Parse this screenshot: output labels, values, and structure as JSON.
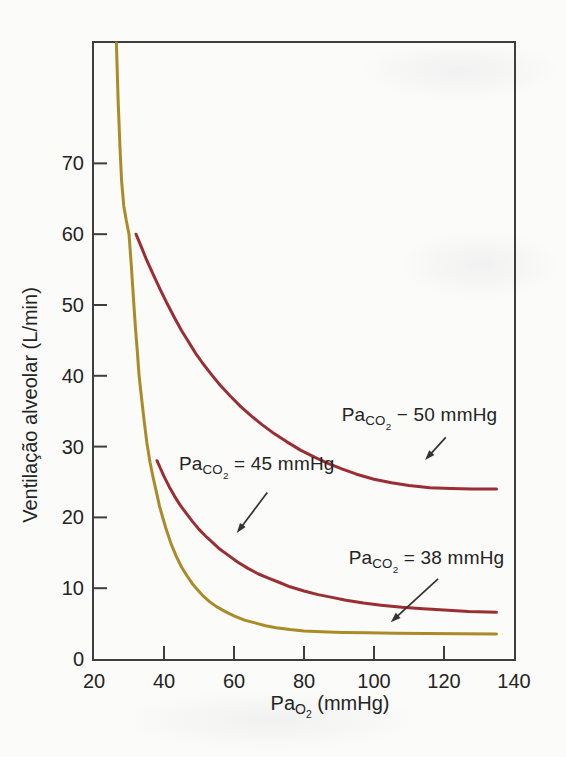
{
  "figure": {
    "background": "#fbfbf9",
    "axis_color": "#3e3e3e",
    "text_color": "#242424",
    "arrow_color": "#333333"
  },
  "chart_data": {
    "type": "line",
    "title": "",
    "ylabel": "Ventilação alveolar (L/min)",
    "xlabel": "PaO2 (mmHg)",
    "xlabel_parts": {
      "base": "Pa",
      "sub": "O",
      "subsub": "2",
      "rest": " (mmHg)"
    },
    "xlim": [
      20,
      140
    ],
    "ylim": [
      0,
      87
    ],
    "x_ticks": [
      20,
      40,
      60,
      80,
      100,
      120,
      140
    ],
    "y_ticks": [
      0,
      10,
      20,
      30,
      40,
      50,
      60,
      70
    ],
    "grid": false,
    "legend_position": "none",
    "series": [
      {
        "id": "paco2-50",
        "name": "PaCO2 − 50 mmHg",
        "color": "#9a2e33",
        "points": [
          [
            32,
            60
          ],
          [
            33.5,
            58.2
          ],
          [
            35,
            56.4
          ],
          [
            37,
            54.2
          ],
          [
            39,
            52.1
          ],
          [
            41,
            50.1
          ],
          [
            43,
            48.2
          ],
          [
            45,
            46.4
          ],
          [
            47,
            44.8
          ],
          [
            49,
            43.2
          ],
          [
            51,
            41.8
          ],
          [
            53.5,
            40.2
          ],
          [
            56,
            38.7
          ],
          [
            59,
            37.1
          ],
          [
            62,
            35.6
          ],
          [
            65,
            34.3
          ],
          [
            68,
            33.1
          ],
          [
            71,
            32
          ],
          [
            75,
            30.7
          ],
          [
            79,
            29.5
          ],
          [
            83,
            28.5
          ],
          [
            87,
            27.6
          ],
          [
            91,
            26.8
          ],
          [
            95,
            26.1
          ],
          [
            100,
            25.4
          ],
          [
            105,
            24.9
          ],
          [
            110,
            24.5
          ],
          [
            116,
            24.2
          ],
          [
            122,
            24.1
          ],
          [
            128,
            24
          ],
          [
            135,
            24
          ]
        ]
      },
      {
        "id": "paco2-45",
        "name": "PaCO2 = 45 mmHg",
        "color": "#9a2e33",
        "points": [
          [
            38,
            28
          ],
          [
            39,
            26.9
          ],
          [
            40,
            25.8
          ],
          [
            41.5,
            24.3
          ],
          [
            43,
            23
          ],
          [
            44.5,
            21.8
          ],
          [
            46,
            20.8
          ],
          [
            48,
            19.5
          ],
          [
            50,
            18.3
          ],
          [
            52,
            17.3
          ],
          [
            54,
            16.4
          ],
          [
            56,
            15.5
          ],
          [
            58.5,
            14.6
          ],
          [
            61,
            13.7
          ],
          [
            64,
            12.8
          ],
          [
            67,
            12
          ],
          [
            70,
            11.4
          ],
          [
            73,
            10.8
          ],
          [
            76,
            10.2
          ],
          [
            80,
            9.6
          ],
          [
            84,
            9.1
          ],
          [
            88,
            8.7
          ],
          [
            92,
            8.3
          ],
          [
            97,
            7.9
          ],
          [
            102,
            7.6
          ],
          [
            108,
            7.3
          ],
          [
            114,
            7.1
          ],
          [
            120,
            6.9
          ],
          [
            127,
            6.7
          ],
          [
            135,
            6.6
          ]
        ]
      },
      {
        "id": "paco2-38",
        "name": "PaCO2 = 38 mmHg",
        "color": "#ab8a28",
        "points": [
          [
            26.4,
            87
          ],
          [
            26.9,
            79
          ],
          [
            27.4,
            72.5
          ],
          [
            27.9,
            67.5
          ],
          [
            28.5,
            64
          ],
          [
            29.2,
            62
          ],
          [
            30,
            60
          ],
          [
            30.6,
            56
          ],
          [
            31,
            53
          ],
          [
            31.4,
            50
          ],
          [
            31.9,
            46.5
          ],
          [
            32.4,
            43.3
          ],
          [
            32.9,
            40
          ],
          [
            33.6,
            36.8
          ],
          [
            34.3,
            33.8
          ],
          [
            35.1,
            30.5
          ],
          [
            36,
            27.8
          ],
          [
            37,
            25.4
          ],
          [
            38,
            23.2
          ],
          [
            38.7,
            21.6
          ],
          [
            39.5,
            20.2
          ],
          [
            40.5,
            18.5
          ],
          [
            42,
            16.3
          ],
          [
            43.5,
            14.5
          ],
          [
            45,
            13
          ],
          [
            46.5,
            11.8
          ],
          [
            48,
            10.7
          ],
          [
            49.5,
            9.8
          ],
          [
            51,
            9
          ],
          [
            53,
            8.1
          ],
          [
            55,
            7.4
          ],
          [
            57.5,
            6.7
          ],
          [
            60,
            6.1
          ],
          [
            63,
            5.5
          ],
          [
            66,
            5.1
          ],
          [
            69,
            4.7
          ],
          [
            72,
            4.4
          ],
          [
            76,
            4.15
          ],
          [
            80,
            3.95
          ],
          [
            85,
            3.85
          ],
          [
            91,
            3.75
          ],
          [
            98,
            3.7
          ],
          [
            106,
            3.65
          ],
          [
            115,
            3.6
          ],
          [
            125,
            3.58
          ],
          [
            135,
            3.55
          ]
        ]
      }
    ],
    "annotations": [
      {
        "series": 0,
        "parts": {
          "base": "Pa",
          "sub": "CO",
          "subsub": "2",
          "rest": " − 50 mmHg"
        },
        "text_center": [
          113,
          34
        ],
        "arrow_from": [
          120.5,
          31.3
        ],
        "arrow_to": [
          114.6,
          28.1
        ]
      },
      {
        "series": 1,
        "parts": {
          "base": "Pa",
          "sub": "CO",
          "subsub": "2",
          "rest": " = 45 mmHg"
        },
        "text_center": [
          66.5,
          27.1
        ],
        "arrow_from": [
          69.5,
          23.5
        ],
        "arrow_to": [
          60.8,
          17.8
        ]
      },
      {
        "series": 2,
        "parts": {
          "base": "Pa",
          "sub": "CO",
          "subsub": "2",
          "rest": " = 38 mmHg"
        },
        "text_center": [
          115,
          13.9
        ],
        "arrow_from": [
          118.3,
          11.3
        ],
        "arrow_to": [
          104.8,
          5.2
        ]
      }
    ]
  }
}
